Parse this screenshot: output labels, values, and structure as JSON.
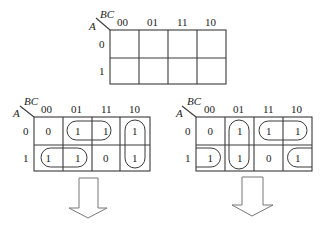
{
  "diagram": {
    "type": "karnaugh-maps",
    "variables": {
      "row_var": "A",
      "col_vars": "BC"
    },
    "col_headers": [
      "00",
      "01",
      "11",
      "10"
    ],
    "row_headers": [
      "0",
      "1"
    ],
    "maps": [
      {
        "id": "empty",
        "cells": [
          [
            "",
            "",
            "",
            ""
          ],
          [
            "",
            "",
            "",
            ""
          ]
        ],
        "groups": []
      },
      {
        "id": "grouping-1",
        "cells": [
          [
            "0",
            "1",
            "1",
            "1"
          ],
          [
            "1",
            "1",
            "0",
            "1"
          ]
        ],
        "groups": [
          {
            "cells": [
              "A0-01",
              "A0-11"
            ],
            "shape": "horizontal-pair"
          },
          {
            "cells": [
              "A1-00",
              "A1-01"
            ],
            "shape": "horizontal-pair"
          },
          {
            "cells": [
              "A0-10",
              "A1-10"
            ],
            "shape": "vertical-pair"
          }
        ]
      },
      {
        "id": "grouping-2",
        "cells": [
          [
            "0",
            "1",
            "1",
            "1"
          ],
          [
            "1",
            "1",
            "0",
            "1"
          ]
        ],
        "groups": [
          {
            "cells": [
              "A0-01",
              "A1-01"
            ],
            "shape": "vertical-pair"
          },
          {
            "cells": [
              "A0-11",
              "A0-10"
            ],
            "shape": "horizontal-pair"
          },
          {
            "cells": [
              "A1-00",
              "A1-10"
            ],
            "shape": "wrap-around-pair"
          }
        ]
      }
    ],
    "arrows": [
      {
        "under": "grouping-1",
        "direction": "down"
      },
      {
        "under": "grouping-2",
        "direction": "down"
      }
    ]
  },
  "labels": {
    "map0": {
      "bc": "BC",
      "a": "A",
      "cols": [
        "00",
        "01",
        "11",
        "10"
      ],
      "rows": [
        "0",
        "1"
      ],
      "cells": [
        [
          "",
          "",
          "",
          ""
        ],
        [
          "",
          "",
          "",
          ""
        ]
      ]
    },
    "map1": {
      "bc": "BC",
      "a": "A",
      "cols": [
        "00",
        "01",
        "11",
        "10"
      ],
      "rows": [
        "0",
        "1"
      ],
      "cells": [
        [
          "0",
          "1",
          "1",
          "1"
        ],
        [
          "1",
          "1",
          "0",
          "1"
        ]
      ]
    },
    "map2": {
      "bc": "BC",
      "a": "A",
      "cols": [
        "00",
        "01",
        "11",
        "10"
      ],
      "rows": [
        "0",
        "1"
      ],
      "cells": [
        [
          "0",
          "1",
          "1",
          "1"
        ],
        [
          "1",
          "1",
          "0",
          "1"
        ]
      ]
    }
  }
}
